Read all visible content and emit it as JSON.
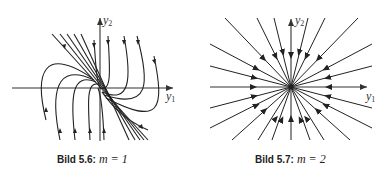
{
  "figures": [
    {
      "id": "left",
      "caption_label": "Bild 5.6:",
      "caption_math": "m = 1",
      "x_axis_label": "y",
      "x_axis_sub": "1",
      "y_axis_label": "y",
      "y_axis_sub": "2",
      "type": "degenerate-node phase portrait"
    },
    {
      "id": "right",
      "caption_label": "Bild 5.7:",
      "caption_math": "m = 2",
      "x_axis_label": "y",
      "x_axis_sub": "1",
      "y_axis_label": "y",
      "y_axis_sub": "2",
      "type": "star-node phase portrait"
    }
  ],
  "colors": {
    "stroke": "#222222",
    "axis": "#333333",
    "background": "#ffffff"
  }
}
